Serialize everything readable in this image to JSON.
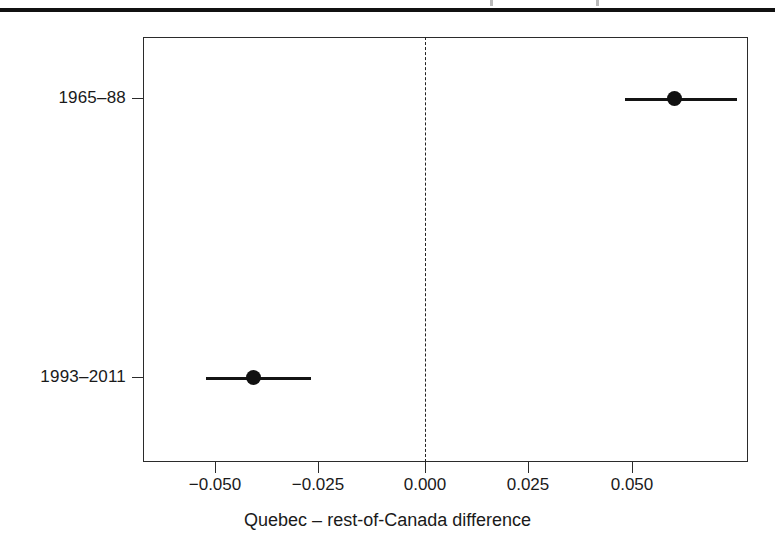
{
  "figure": {
    "top_rule": "page-rule",
    "background_color": "#ffffff",
    "axis_color": "#2b2b2b",
    "data_color": "#111111"
  },
  "chart_data": {
    "type": "scatter",
    "subtype": "forest-plot",
    "title": "",
    "xlabel": "Quebec – rest-of-Canada difference",
    "ylabel": "",
    "orientation": "horizontal",
    "categories": [
      "1965–88",
      "1993–2011"
    ],
    "values": [
      0.048,
      -0.04
    ],
    "error_low": [
      0.0375,
      -0.05
    ],
    "error_high": [
      0.061,
      -0.028
    ],
    "points": [
      {
        "label": "1965–88",
        "estimate": 0.048,
        "ci_low": 0.0375,
        "ci_high": 0.061
      },
      {
        "label": "1993–2011",
        "estimate": -0.04,
        "ci_low": -0.05,
        "ci_high": -0.028
      }
    ],
    "xlim": [
      -0.0632,
      0.0633
    ],
    "xticks": [
      -0.05,
      -0.025,
      0.0,
      0.025,
      0.05
    ],
    "xticklabels": [
      "−0.050",
      "−0.025",
      "0.000",
      "0.025",
      "0.050"
    ],
    "reference_line": {
      "value": 0.0,
      "style": "dashed",
      "orientation": "vertical"
    },
    "grid": false,
    "legend": null
  }
}
